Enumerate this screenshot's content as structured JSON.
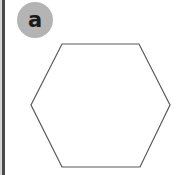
{
  "figure": {
    "panel_label": "a",
    "background_color": "#ffffff",
    "badge_color": "#b4b4b4",
    "badge_text_color": "#1a1a1a",
    "rule_color": "#4a4a4a",
    "shape_stroke_color": "#595959",
    "shape_fill_color": "#ffffff",
    "shape_name": "hexagon",
    "shape_sides": 6,
    "shape_points": "62,44 139,44 170,105 140,167 62,167 31,105"
  }
}
